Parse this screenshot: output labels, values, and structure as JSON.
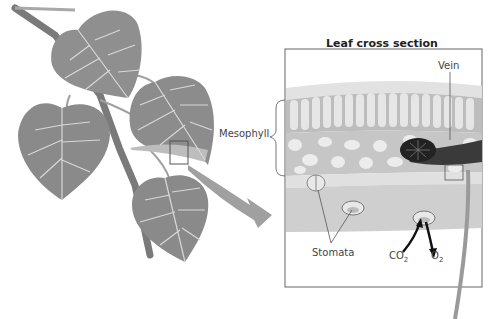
{
  "figure": {
    "title": "Leaf cross section",
    "labels": {
      "vein": "Vein",
      "mesophyll": "Mesophyll",
      "stomata": "Stomata",
      "co2_main": "CO",
      "co2_sub": "2",
      "o2_main": "O",
      "o2_sub": "2"
    },
    "colors": {
      "leaf": "#8a8a8a",
      "leaf_vein": "#d8d8d8",
      "stem": "#7a7a7a",
      "panel_border": "#555555",
      "tissue": "#cfcfcf",
      "vein_bundle": "#2a2a2a",
      "arrow": "#a0a0a0"
    }
  }
}
